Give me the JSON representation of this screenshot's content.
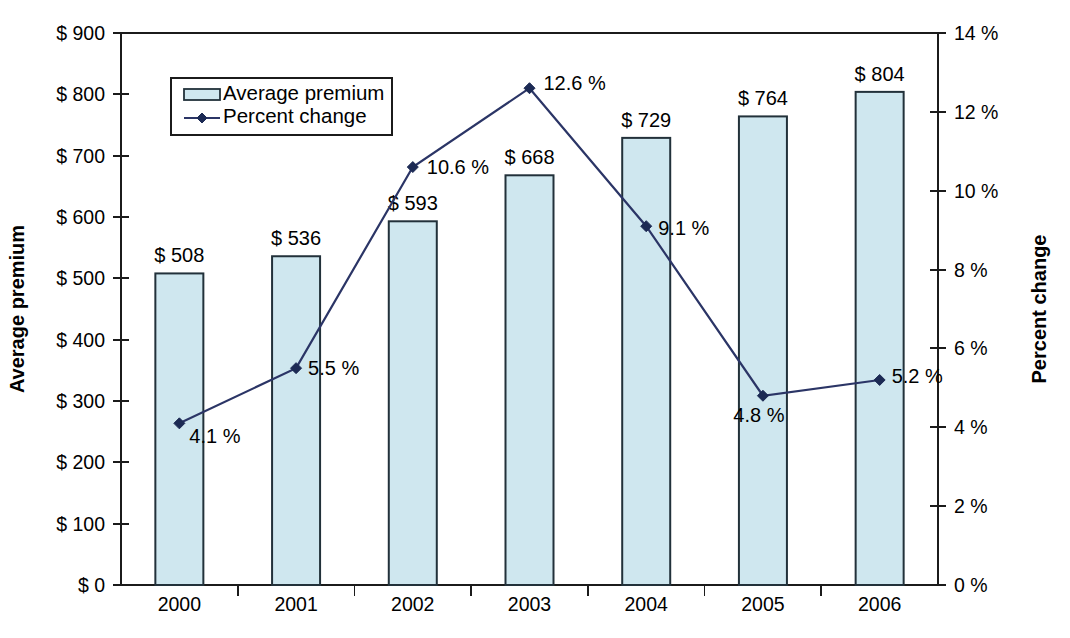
{
  "chart_data": {
    "type": "bar",
    "title": "",
    "subtitle": "",
    "xlabel": "",
    "ylabel": "Average premium",
    "y2label": "Percent change",
    "categories": [
      "2000",
      "2001",
      "2002",
      "2003",
      "2004",
      "2005",
      "2006"
    ],
    "grid": false,
    "legend_position": "top-left inside plot",
    "series": [
      {
        "name": "Average premium",
        "type": "bar",
        "axis": "left",
        "values": [
          508,
          536,
          593,
          668,
          729,
          764,
          804
        ],
        "data_labels": [
          "$ 508",
          "$ 536",
          "$ 593",
          "$ 668",
          "$ 729",
          "$ 764",
          "$ 804"
        ],
        "fill_color": "#cfe7ef",
        "border_color": "#22313a"
      },
      {
        "name": "Percent change",
        "type": "line",
        "axis": "right",
        "values": [
          4.1,
          5.5,
          10.6,
          12.6,
          9.1,
          4.8,
          5.2
        ],
        "data_labels": [
          "4.1 %",
          "5.5 %",
          "10.6 %",
          "12.6 %",
          "9.1 %",
          "4.8 %",
          "5.2 %"
        ],
        "line_color": "#2b3566",
        "marker_color": "#1c2a54",
        "marker": "diamond"
      }
    ],
    "yaxis_left": {
      "label": "Average premium",
      "min": 0,
      "max": 900,
      "step": 100,
      "tick_labels": [
        "$ 0",
        "$ 100",
        "$ 200",
        "$ 300",
        "$ 400",
        "$ 500",
        "$ 600",
        "$ 700",
        "$ 800",
        "$ 900"
      ],
      "tick_values": [
        0,
        100,
        200,
        300,
        400,
        500,
        600,
        700,
        800,
        900
      ]
    },
    "yaxis_right": {
      "label": "Percent change",
      "min": 0,
      "max": 14,
      "step": 2,
      "tick_labels": [
        "0 %",
        "2 %",
        "4 %",
        "6 %",
        "8 %",
        "10 %",
        "12 %",
        "14 %"
      ],
      "tick_values": [
        0,
        2,
        4,
        6,
        8,
        10,
        12,
        14
      ]
    },
    "xaxis": {
      "tick_labels": [
        "2000",
        "2001",
        "2002",
        "2003",
        "2004",
        "2005",
        "2006"
      ]
    },
    "legend": {
      "entries": [
        {
          "label": "Average premium",
          "marker": "bar-swatch"
        },
        {
          "label": "Percent change",
          "marker": "line-diamond"
        }
      ]
    },
    "colors": {
      "bar_fill": "#cfe7ef",
      "bar_border": "#22313a",
      "line": "#2b3566",
      "marker": "#1c2a54",
      "axis": "#1b1b1b",
      "text": "#000000",
      "background": "#ffffff"
    },
    "label_offsets": {
      "percent": [
        {
          "dx": 10,
          "dy": 20,
          "anchor": "start"
        },
        {
          "dx": 12,
          "dy": 7,
          "anchor": "start"
        },
        {
          "dx": 14,
          "dy": 7,
          "anchor": "start"
        },
        {
          "dx": 14,
          "dy": 2,
          "anchor": "start"
        },
        {
          "dx": 12,
          "dy": 9,
          "anchor": "start"
        },
        {
          "dx": -4,
          "dy": 26,
          "anchor": "middle"
        },
        {
          "dx": 12,
          "dy": 3,
          "anchor": "start"
        }
      ]
    }
  }
}
